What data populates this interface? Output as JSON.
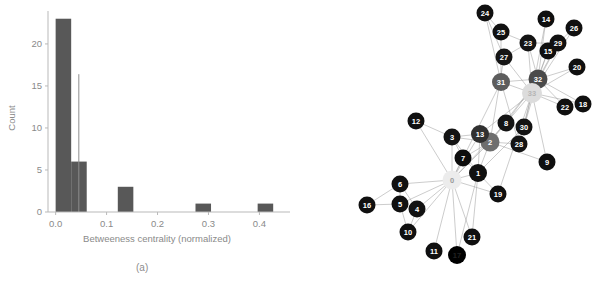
{
  "figure": {
    "background": "#ffffff",
    "panels": [
      {
        "id": "a",
        "caption": "(a)"
      },
      {
        "id": "b",
        "caption": "(b)"
      }
    ]
  },
  "chart_data": [
    {
      "type": "bar",
      "panel": "a",
      "title": "",
      "xlabel": "Betweeness centrality (normalized)",
      "ylabel": "Count",
      "xlim": [
        -0.015,
        0.46
      ],
      "ylim": [
        0,
        23.8
      ],
      "xticks": [
        0.0,
        0.1,
        0.2,
        0.3,
        0.4
      ],
      "xticklabels": [
        "0.0",
        "0.1",
        "0.2",
        "0.3",
        "0.4"
      ],
      "yticks": [
        0,
        5,
        10,
        15,
        20
      ],
      "yticklabels": [
        "0",
        "5",
        "10",
        "15",
        "20"
      ],
      "grid": false,
      "bar_color": "#585858",
      "bin_edges": [
        0.0,
        0.0305,
        0.061,
        0.0915,
        0.122,
        0.1525,
        0.183,
        0.2135,
        0.244,
        0.2745,
        0.305,
        0.3355,
        0.366,
        0.3965,
        0.427,
        0.4575
      ],
      "categories": [
        "0.000-0.031",
        "0.031-0.061",
        "0.061-0.092",
        "0.092-0.122",
        "0.122-0.153",
        "0.153-0.183",
        "0.183-0.214",
        "0.214-0.244",
        "0.244-0.275",
        "0.275-0.305",
        "0.305-0.336",
        "0.336-0.366",
        "0.366-0.397",
        "0.397-0.427",
        "0.427-0.458"
      ],
      "values": [
        23,
        6,
        0,
        0,
        3,
        0,
        0,
        0,
        0,
        1,
        0,
        0,
        0,
        1,
        0
      ],
      "annotations": [
        {
          "kind": "vertical-line",
          "x": 0.0455,
          "y0": 0.0,
          "y1": 16.4,
          "color": "#8e8e8e",
          "label": "mean-marker"
        }
      ]
    },
    {
      "type": "graph",
      "panel": "b",
      "title": "",
      "description": "Zachary karate club network, nodes shaded by betweenness centrality",
      "node_count": 34,
      "colormap": "gray (light = high betweenness, dark = low)",
      "nodes": [
        {
          "id": "0",
          "label": "0",
          "x": 152,
          "y": 180,
          "r": 9.5,
          "color": "#ececec",
          "text_color": "#9a9a9a"
        },
        {
          "id": "1",
          "label": "1",
          "x": 178,
          "y": 173,
          "r": 9.0,
          "color": "#101010",
          "text_color": "#ffffff"
        },
        {
          "id": "2",
          "label": "2",
          "x": 190,
          "y": 142,
          "r": 9.5,
          "color": "#6e6e6e",
          "text_color": "#ffffff"
        },
        {
          "id": "3",
          "label": "3",
          "x": 152,
          "y": 137,
          "r": 8.5,
          "color": "#131313",
          "text_color": "#ffffff"
        },
        {
          "id": "4",
          "label": "4",
          "x": 117,
          "y": 209,
          "r": 8.5,
          "color": "#121212",
          "text_color": "#ffffff"
        },
        {
          "id": "5",
          "label": "5",
          "x": 100,
          "y": 204,
          "r": 8.5,
          "color": "#111111",
          "text_color": "#ffffff"
        },
        {
          "id": "6",
          "label": "6",
          "x": 100,
          "y": 184,
          "r": 8.5,
          "color": "#111111",
          "text_color": "#ffffff"
        },
        {
          "id": "7",
          "label": "7",
          "x": 163,
          "y": 158,
          "r": 8.5,
          "color": "#0d0d0d",
          "text_color": "#ffffff"
        },
        {
          "id": "8",
          "label": "8",
          "x": 206,
          "y": 123,
          "r": 8.5,
          "color": "#141414",
          "text_color": "#ffffff"
        },
        {
          "id": "9",
          "label": "9",
          "x": 247,
          "y": 162,
          "r": 8.5,
          "color": "#0f0f0f",
          "text_color": "#ffffff"
        },
        {
          "id": "10",
          "label": "10",
          "x": 108,
          "y": 232,
          "r": 8.5,
          "color": "#101010",
          "text_color": "#ffffff"
        },
        {
          "id": "11",
          "label": "11",
          "x": 134,
          "y": 251,
          "r": 8.5,
          "color": "#101010",
          "text_color": "#ffffff"
        },
        {
          "id": "12",
          "label": "12",
          "x": 116,
          "y": 121,
          "r": 8.5,
          "color": "#101010",
          "text_color": "#ffffff"
        },
        {
          "id": "13",
          "label": "13",
          "x": 180,
          "y": 134,
          "r": 9.0,
          "color": "#303030",
          "text_color": "#ffffff"
        },
        {
          "id": "14",
          "label": "14",
          "x": 246,
          "y": 19,
          "r": 8.5,
          "color": "#0f0f0f",
          "text_color": "#ffffff"
        },
        {
          "id": "15",
          "label": "15",
          "x": 248,
          "y": 51,
          "r": 8.5,
          "color": "#0f0f0f",
          "text_color": "#ffffff"
        },
        {
          "id": "16",
          "label": "16",
          "x": 67,
          "y": 205,
          "r": 8.5,
          "color": "#101010",
          "text_color": "#ffffff"
        },
        {
          "id": "17",
          "label": "17",
          "x": 157,
          "y": 255,
          "r": 9.0,
          "color": "#000000",
          "text_color": "#222222"
        },
        {
          "id": "18",
          "label": "18",
          "x": 283,
          "y": 104,
          "r": 8.5,
          "color": "#101010",
          "text_color": "#ffffff"
        },
        {
          "id": "19",
          "label": "19",
          "x": 198,
          "y": 194,
          "r": 8.5,
          "color": "#0f0f0f",
          "text_color": "#ffffff"
        },
        {
          "id": "20",
          "label": "20",
          "x": 277,
          "y": 67,
          "r": 8.5,
          "color": "#101010",
          "text_color": "#ffffff"
        },
        {
          "id": "21",
          "label": "21",
          "x": 172,
          "y": 237,
          "r": 8.5,
          "color": "#101010",
          "text_color": "#ffffff"
        },
        {
          "id": "22",
          "label": "22",
          "x": 265,
          "y": 107,
          "r": 8.5,
          "color": "#101010",
          "text_color": "#ffffff"
        },
        {
          "id": "23",
          "label": "23",
          "x": 228,
          "y": 43,
          "r": 8.5,
          "color": "#141414",
          "text_color": "#ffffff"
        },
        {
          "id": "24",
          "label": "24",
          "x": 185,
          "y": 13,
          "r": 8.5,
          "color": "#101010",
          "text_color": "#ffffff"
        },
        {
          "id": "25",
          "label": "25",
          "x": 201,
          "y": 32,
          "r": 8.5,
          "color": "#111111",
          "text_color": "#ffffff"
        },
        {
          "id": "26",
          "label": "26",
          "x": 274,
          "y": 28,
          "r": 8.5,
          "color": "#101010",
          "text_color": "#ffffff"
        },
        {
          "id": "27",
          "label": "27",
          "x": 204,
          "y": 57,
          "r": 8.5,
          "color": "#151515",
          "text_color": "#ffffff"
        },
        {
          "id": "28",
          "label": "28",
          "x": 219,
          "y": 144,
          "r": 8.5,
          "color": "#141414",
          "text_color": "#ffffff"
        },
        {
          "id": "29",
          "label": "29",
          "x": 258,
          "y": 43,
          "r": 8.5,
          "color": "#111111",
          "text_color": "#ffffff"
        },
        {
          "id": "30",
          "label": "30",
          "x": 224,
          "y": 127,
          "r": 8.5,
          "color": "#131313",
          "text_color": "#ffffff"
        },
        {
          "id": "31",
          "label": "31",
          "x": 201,
          "y": 82,
          "r": 9.0,
          "color": "#5d5d5d",
          "text_color": "#ffffff"
        },
        {
          "id": "32",
          "label": "32",
          "x": 238,
          "y": 79,
          "r": 9.5,
          "color": "#4a4a4a",
          "text_color": "#ffffff"
        },
        {
          "id": "33",
          "label": "33",
          "x": 232,
          "y": 93,
          "r": 10.0,
          "color": "#dcdcdc",
          "text_color": "#b5b5b5"
        }
      ],
      "edges": [
        [
          "0",
          "1"
        ],
        [
          "0",
          "2"
        ],
        [
          "0",
          "3"
        ],
        [
          "0",
          "4"
        ],
        [
          "0",
          "5"
        ],
        [
          "0",
          "6"
        ],
        [
          "0",
          "7"
        ],
        [
          "0",
          "8"
        ],
        [
          "0",
          "10"
        ],
        [
          "0",
          "11"
        ],
        [
          "0",
          "12"
        ],
        [
          "0",
          "13"
        ],
        [
          "0",
          "17"
        ],
        [
          "0",
          "19"
        ],
        [
          "0",
          "21"
        ],
        [
          "0",
          "31"
        ],
        [
          "1",
          "2"
        ],
        [
          "1",
          "3"
        ],
        [
          "1",
          "7"
        ],
        [
          "1",
          "13"
        ],
        [
          "1",
          "17"
        ],
        [
          "1",
          "19"
        ],
        [
          "1",
          "21"
        ],
        [
          "1",
          "30"
        ],
        [
          "2",
          "3"
        ],
        [
          "2",
          "7"
        ],
        [
          "2",
          "8"
        ],
        [
          "2",
          "9"
        ],
        [
          "2",
          "13"
        ],
        [
          "2",
          "27"
        ],
        [
          "2",
          "28"
        ],
        [
          "2",
          "32"
        ],
        [
          "3",
          "7"
        ],
        [
          "3",
          "12"
        ],
        [
          "3",
          "13"
        ],
        [
          "4",
          "6"
        ],
        [
          "4",
          "10"
        ],
        [
          "5",
          "6"
        ],
        [
          "5",
          "10"
        ],
        [
          "5",
          "16"
        ],
        [
          "6",
          "16"
        ],
        [
          "8",
          "30"
        ],
        [
          "8",
          "32"
        ],
        [
          "8",
          "33"
        ],
        [
          "9",
          "33"
        ],
        [
          "13",
          "33"
        ],
        [
          "14",
          "32"
        ],
        [
          "14",
          "33"
        ],
        [
          "15",
          "32"
        ],
        [
          "15",
          "33"
        ],
        [
          "18",
          "32"
        ],
        [
          "18",
          "33"
        ],
        [
          "19",
          "33"
        ],
        [
          "20",
          "32"
        ],
        [
          "20",
          "33"
        ],
        [
          "22",
          "32"
        ],
        [
          "22",
          "33"
        ],
        [
          "23",
          "25"
        ],
        [
          "23",
          "27"
        ],
        [
          "23",
          "29"
        ],
        [
          "23",
          "32"
        ],
        [
          "23",
          "33"
        ],
        [
          "24",
          "25"
        ],
        [
          "24",
          "27"
        ],
        [
          "24",
          "31"
        ],
        [
          "25",
          "31"
        ],
        [
          "26",
          "29"
        ],
        [
          "26",
          "33"
        ],
        [
          "27",
          "33"
        ],
        [
          "28",
          "31"
        ],
        [
          "28",
          "33"
        ],
        [
          "29",
          "32"
        ],
        [
          "29",
          "33"
        ],
        [
          "30",
          "32"
        ],
        [
          "30",
          "33"
        ],
        [
          "31",
          "32"
        ],
        [
          "31",
          "33"
        ],
        [
          "32",
          "33"
        ]
      ]
    }
  ]
}
